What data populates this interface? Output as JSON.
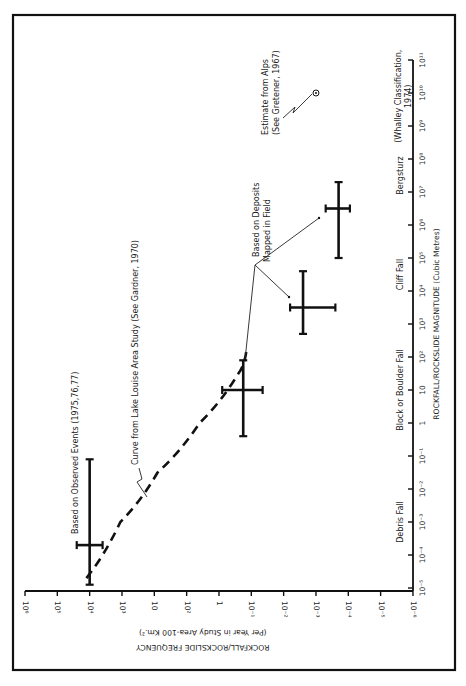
{
  "chart_data": {
    "type": "scatter",
    "orientation_note": "figure printed rotated 90 degrees counter-clockwise",
    "title": "",
    "xlabel": "ROCKFALL/ROCKSLIDE MAGNITUDE (Cubic Metres)",
    "ylabel": "ROCKFALL/ROCKSLIDE FREQUENCY",
    "ylabel_sub": "(Per Year in Study Area-100 Km.²)",
    "x_scale": "log",
    "y_scale": "log",
    "xlim": [
      "1e-5",
      "1e11"
    ],
    "ylim": [
      "1e-6",
      "1e6"
    ],
    "grid": false,
    "magnitude_ticks": [
      "10⁻⁵",
      "10⁻⁴",
      "10⁻³",
      "10⁻²",
      "10⁻¹",
      "1",
      "10",
      "10²",
      "10³",
      "10⁴",
      "10⁵",
      "10⁶",
      "10⁷",
      "10⁸",
      "10⁹",
      "10¹⁰",
      "10¹¹"
    ],
    "frequency_ticks": [
      "10⁶",
      "10⁵",
      "10⁴",
      "10³",
      "10",
      "10²",
      "1",
      "10⁻¹",
      "10⁻²",
      "10⁻³",
      "10⁻⁴",
      "10⁻⁵",
      "10⁻⁶"
    ],
    "classes": [
      {
        "name": "Debris Fall",
        "range": [
          "1e-5",
          "1e-1"
        ]
      },
      {
        "name": "Block or Boulder Fall",
        "range": [
          "1e-1",
          "1e3"
        ]
      },
      {
        "name": "Cliff Fall",
        "range": [
          "1e3",
          "1e6"
        ]
      },
      {
        "name": "Bergsturz",
        "range": [
          "1e6",
          "1e9"
        ]
      }
    ],
    "classification_note": "(Whalley Classification, 1974)",
    "series": [
      {
        "name": "Based on Observed Events (1975,76,77)",
        "kind": "cross",
        "magnitude_log": -3.7,
        "magnitude_range_log": [
          -4.9,
          -1.1
        ],
        "frequency_log": 4.0,
        "frequency_range_log": [
          3.6,
          4.4
        ]
      },
      {
        "name": "Based on Deposits Mapped in Field",
        "kind": "cross",
        "points": [
          {
            "class": "Block or Boulder Fall",
            "magnitude_log": 1.0,
            "magnitude_range_log": [
              -0.4,
              1.9
            ],
            "frequency_log": -0.75,
            "frequency_range_log": [
              -1.35,
              -0.1
            ]
          },
          {
            "class": "Cliff Fall",
            "magnitude_log": 3.5,
            "magnitude_range_log": [
              2.7,
              4.6
            ],
            "frequency_log": -2.6,
            "frequency_range_log": [
              -3.6,
              -2.2
            ]
          },
          {
            "class": "Bergsturz",
            "magnitude_log": 6.5,
            "magnitude_range_log": [
              5.0,
              7.3
            ],
            "frequency_log": -3.7,
            "frequency_range_log": [
              -4.05,
              -3.3
            ]
          }
        ]
      },
      {
        "name": "Curve from Lake Louise Area Study (See Gardner, 1970)",
        "kind": "dashed-line",
        "magnitude_log": [
          -4.7,
          -3.0,
          -1.5,
          0.0,
          1.5,
          2.2
        ],
        "frequency_log": [
          4.1,
          3.05,
          1.9,
          0.6,
          -0.6,
          -0.85
        ]
      },
      {
        "name": "Estimate from Alps (See Gretener, 1967)",
        "kind": "point",
        "magnitude_log": 10.0,
        "frequency_log": -3.0
      }
    ]
  },
  "annotations": {
    "observed": "Based on Observed Events (1975,76,77)",
    "curve": "Curve from Lake Louise Area Study (See Gardner, 1970)",
    "deposits_line1": "Based on Deposits",
    "deposits_line2": "Mapped in Field",
    "alps_line1": "Estimate from Alps",
    "alps_line2": "(See Gretener, 1967)",
    "whalley_line1": "(Whalley Classification,",
    "whalley_line2": "1974)"
  },
  "colors": {
    "ink": "#111111",
    "paper": "#ffffff"
  }
}
